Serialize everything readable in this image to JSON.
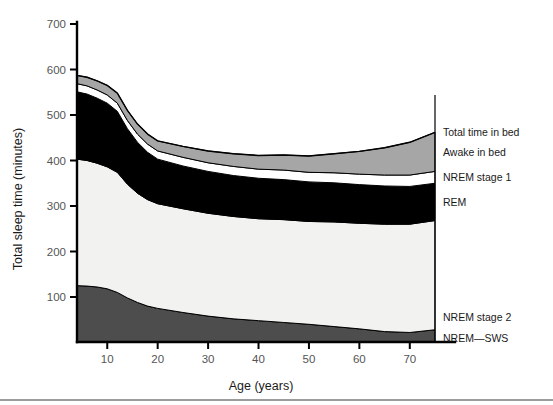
{
  "figure": {
    "background": "#ffffff",
    "width": 553,
    "height": 405
  },
  "chart_data": {
    "type": "area",
    "title": "",
    "subtitle": "",
    "xlabel": "Age (years)",
    "ylabel": "Total sleep time (minutes)",
    "xlim": [
      4,
      75
    ],
    "ylim": [
      0,
      700
    ],
    "xticks": [
      10,
      20,
      30,
      40,
      50,
      60,
      70
    ],
    "xtick_labels": [
      "10",
      "20",
      "30",
      "40",
      "50",
      "60",
      "70"
    ],
    "yticks": [
      100,
      200,
      300,
      400,
      500,
      600,
      700
    ],
    "ytick_labels": [
      "100",
      "200",
      "300",
      "400",
      "500",
      "600",
      "700"
    ],
    "grid": false,
    "stacked": true,
    "legend_position": "right-outside",
    "x": [
      4,
      6,
      8,
      10,
      12,
      14,
      16,
      18,
      20,
      25,
      30,
      35,
      40,
      45,
      50,
      55,
      60,
      65,
      70,
      75
    ],
    "series": [
      {
        "name": "NREM—SWS",
        "color": "#4d4d4d",
        "values": [
          125,
          124,
          122,
          118,
          110,
          98,
          88,
          80,
          75,
          66,
          58,
          52,
          48,
          44,
          40,
          35,
          30,
          24,
          22,
          28
        ]
      },
      {
        "name": "NREM stage 2",
        "color": "#f2f2f0",
        "values": [
          278,
          276,
          272,
          268,
          264,
          250,
          240,
          234,
          230,
          228,
          226,
          225,
          224,
          226,
          226,
          230,
          232,
          236,
          238,
          240
        ]
      },
      {
        "name": "REM",
        "color": "#000000",
        "values": [
          148,
          146,
          143,
          140,
          134,
          122,
          112,
          104,
          98,
          94,
          92,
          90,
          89,
          88,
          87,
          86,
          85,
          84,
          83,
          82
        ]
      },
      {
        "name": "NREM stage 1",
        "color": "#ffffff",
        "values": [
          18,
          18,
          18,
          18,
          18,
          18,
          18,
          18,
          18,
          19,
          19,
          20,
          20,
          21,
          21,
          22,
          23,
          24,
          25,
          26
        ]
      },
      {
        "name": "Awake in bed",
        "color": "#a6a6a6",
        "values": [
          18,
          19,
          20,
          21,
          22,
          22,
          22,
          22,
          22,
          24,
          26,
          28,
          30,
          33,
          36,
          42,
          50,
          60,
          72,
          86
        ]
      }
    ],
    "legend_entries": [
      {
        "label": "Total time in bed",
        "type": "boundary-top"
      },
      {
        "label": "Awake in bed",
        "color": "#a6a6a6"
      },
      {
        "label": "NREM stage 1",
        "color": "#ffffff"
      },
      {
        "label": "REM",
        "color": "#000000"
      },
      {
        "label": "NREM stage 2",
        "color": "#f2f2f0"
      },
      {
        "label": "NREM—SWS",
        "color": "#4d4d4d"
      }
    ],
    "annotations": []
  }
}
